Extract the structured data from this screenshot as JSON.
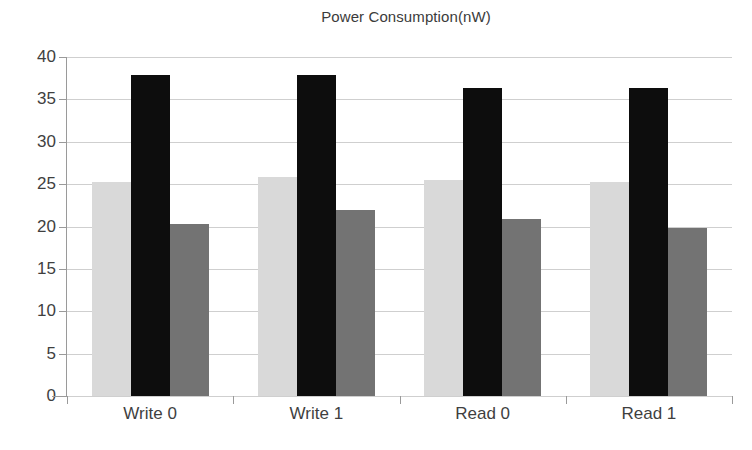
{
  "chart_data": {
    "type": "bar",
    "title": "Power Consumption(nW)",
    "xlabel": "",
    "ylabel": "",
    "categories": [
      "Write 0",
      "Write 1",
      "Read 0",
      "Read 1"
    ],
    "series": [
      {
        "name": "series-1",
        "color": "#d9d9d9",
        "values": [
          25.2,
          25.9,
          25.5,
          25.3
        ]
      },
      {
        "name": "series-2",
        "color": "#0d0d0d",
        "values": [
          37.9,
          37.9,
          36.3,
          36.3
        ]
      },
      {
        "name": "series-3",
        "color": "#737373",
        "values": [
          20.3,
          22.0,
          20.9,
          19.8
        ]
      }
    ],
    "ylim": [
      0,
      40
    ],
    "ytick_labels": [
      "40",
      "35",
      "30",
      "25",
      "20",
      "15",
      "10",
      "5",
      "0"
    ],
    "ytick_values": [
      40,
      35,
      30,
      25,
      20,
      15,
      10,
      5,
      0
    ],
    "grid": true,
    "legend": "none",
    "gridline_color": "#cfcfcf",
    "axis_color": "#9a9a9a",
    "text_color": "#3f3f3f"
  }
}
